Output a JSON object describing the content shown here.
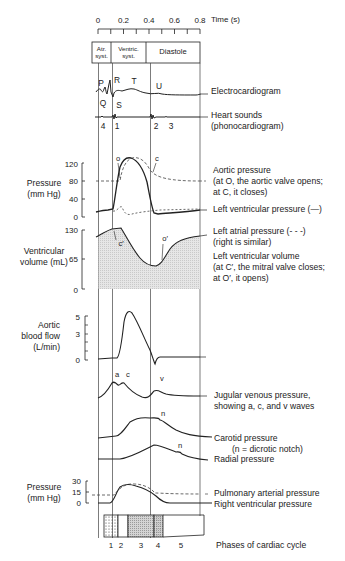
{
  "time_axis": {
    "label": "Time (s)",
    "ticks": [
      "0",
      "0.2",
      "0.4",
      "0.6",
      "0.8"
    ]
  },
  "header_phases": {
    "atrial": [
      "Atr.",
      "syst."
    ],
    "ventricular": [
      "Ventric.",
      "syst."
    ],
    "diastole": "Diastole"
  },
  "ecg": {
    "waves": [
      "P",
      "Q",
      "R",
      "S",
      "T",
      "U"
    ],
    "label": "Electrocardiogram"
  },
  "heart_sounds": {
    "numbers": [
      "4",
      "1",
      "2",
      "3"
    ],
    "label_line1": "Heart sounds",
    "label_line2": "(phonocardiogram)"
  },
  "pressure_panel": {
    "ylabel_line1": "Pressure",
    "ylabel_line2": "(mm Hg)",
    "ticks": [
      "120",
      "80",
      "40",
      "0"
    ],
    "markers": [
      "o",
      "c"
    ],
    "aortic_label": [
      "Aortic pressure",
      "(at O, the aortic valve opens;",
      "at C, it closes)"
    ],
    "lv_label": "Left ventricular pressure (—)",
    "la_label": [
      "Left atrial pressure (- - -)",
      "(right is similar)"
    ]
  },
  "volume_panel": {
    "ylabel_line1": "Ventricular",
    "ylabel_line2": "volume (mL)",
    "ticks": [
      "130",
      "65",
      "0"
    ],
    "markers": [
      "c′",
      "o′"
    ],
    "label": [
      "Left ventricular volume",
      "(at C′, the mitral valve closes;",
      "at O′, it opens)"
    ]
  },
  "aortic_flow_panel": {
    "ylabel": [
      "Aortic",
      "blood flow",
      "(L/min)"
    ],
    "ticks": [
      "5",
      "3",
      "0"
    ]
  },
  "jugular": {
    "waves": [
      "a",
      "c",
      "v"
    ],
    "label": [
      "Jugular venous pressure,",
      "showing a, c, and v waves"
    ]
  },
  "carotid": {
    "marker": "n",
    "label": [
      "Carotid pressure",
      "(n  =  dicrotic notch)"
    ]
  },
  "radial": {
    "marker": "n",
    "label": "Radial pressure"
  },
  "right_pressure_panel": {
    "ylabel_line1": "Pressure",
    "ylabel_line2": "(mm Hg)",
    "ticks": [
      "30",
      "15",
      "0"
    ],
    "pulmonary_label": "Pulmonary arterial pressure",
    "rv_label": "Right ventricular pressure"
  },
  "phases": {
    "numbers": [
      "1",
      "2",
      "3",
      "4",
      "5"
    ],
    "label": "Phases of cardiac cycle"
  }
}
